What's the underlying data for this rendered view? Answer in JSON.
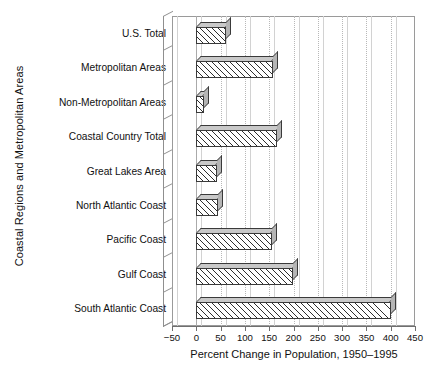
{
  "chart_data": {
    "type": "bar",
    "orientation": "horizontal",
    "title": "",
    "xlabel": "Percent Change in Population, 1950–1995",
    "ylabel": "Coastal Regions and Metropolitan Areas",
    "xlim": [
      -50,
      450
    ],
    "xticks": [
      -50,
      0,
      50,
      100,
      150,
      200,
      250,
      300,
      350,
      400,
      450
    ],
    "xticklabels": [
      "−50",
      "0",
      "50",
      "100",
      "150",
      "200",
      "250",
      "300",
      "350",
      "400",
      "450"
    ],
    "grid": "vertical-dotted",
    "legend": "none",
    "categories": [
      "U.S. Total",
      "Metropolitan Areas",
      "Non-Metropolitan Areas",
      "Coastal Country Total",
      "Great Lakes Area",
      "North Atlantic Coast",
      "Pacific Coast",
      "Gulf Coast",
      "South Atlantic Coast"
    ],
    "values": [
      62,
      157,
      15,
      166,
      42,
      45,
      155,
      200,
      400
    ],
    "series": [
      {
        "name": "Percent Change in Population, 1950-1995",
        "values": [
          62,
          157,
          15,
          166,
          42,
          45,
          155,
          200,
          400
        ]
      }
    ],
    "bar_style": {
      "fill": "diagonal-hatch",
      "edge_color": "#3a3a3a",
      "top_face_color": "#c9c9c9",
      "side_face_color": "#b5b5b5",
      "three_d": true
    }
  },
  "axes": {
    "x_axis_name": "x-axis",
    "y_axis_name": "y-axis"
  }
}
